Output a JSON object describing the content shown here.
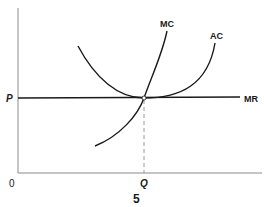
{
  "diagram": {
    "type": "economics-cost-curves",
    "axes": {
      "origin_label": "0",
      "y_axis_label": "",
      "x_axis_label": ""
    },
    "labels": {
      "price": "P",
      "quantity": "Q",
      "mc": "MC",
      "ac": "AC",
      "mr": "MR",
      "figure_number": "5"
    },
    "colors": {
      "curve": "#1a1a1a",
      "axis": "#8a8a8a",
      "dashed": "#9a9a9a",
      "point_fill": "#ffffff"
    }
  }
}
